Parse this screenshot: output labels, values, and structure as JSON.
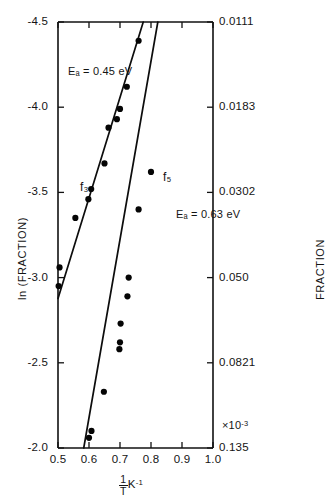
{
  "chart_data": {
    "type": "scatter",
    "title": "",
    "xlabel": "1/T K^-1",
    "xlabel_parts": {
      "numerator": "1",
      "denominator": "T",
      "unit": "K",
      "unit_exponent": "-1"
    },
    "ylabel": "ln (FRACTION)",
    "ylabel_right": "FRACTION",
    "x_multiplier": "×10",
    "x_multiplier_exponent": "-3",
    "xlim": [
      0.5,
      1.0
    ],
    "ylim": [
      -2.0,
      -4.5
    ],
    "grid": false,
    "legend_position": "inline-annotations",
    "x_ticks": [
      "0.5",
      "0.6",
      "0.7",
      "0.8",
      "0.9",
      "1.0"
    ],
    "x_tick_values": [
      0.5,
      0.6,
      0.7,
      0.8,
      0.9,
      1.0
    ],
    "y_ticks_left": [
      "-4.5",
      "-4.0",
      "-3.5",
      "-3.0",
      "-2.5",
      "-2.0"
    ],
    "y_tick_values_left": [
      -4.5,
      -4.0,
      -3.5,
      -3.0,
      -2.5,
      -2.0
    ],
    "y_ticks_right": [
      "0.0111",
      "0.0183",
      "0.0302",
      "0.050",
      "0.0821",
      "0.135"
    ],
    "y_tick_values_right": [
      0.0111,
      0.0183,
      0.0302,
      0.05,
      0.0821,
      0.135
    ],
    "series": [
      {
        "name": "f3",
        "label": "f₃",
        "activation_energy_label": "Eₐ = 0.45 eV",
        "activation_energy_value": 0.45,
        "activation_energy_units": "eV",
        "points": [
          {
            "x": 0.502,
            "y": -2.95
          },
          {
            "x": 0.505,
            "y": -3.06
          },
          {
            "x": 0.556,
            "y": -3.35
          },
          {
            "x": 0.598,
            "y": -3.46
          },
          {
            "x": 0.607,
            "y": -3.52
          },
          {
            "x": 0.65,
            "y": -3.67
          },
          {
            "x": 0.663,
            "y": -3.88
          },
          {
            "x": 0.69,
            "y": -3.93
          },
          {
            "x": 0.7,
            "y": -3.99
          },
          {
            "x": 0.722,
            "y": -4.12
          },
          {
            "x": 0.76,
            "y": -4.39
          }
        ],
        "fit_endpoints": [
          {
            "x": 0.497,
            "y": -2.86
          },
          {
            "x": 0.775,
            "y": -4.5
          }
        ]
      },
      {
        "name": "f5",
        "label": "f₅",
        "activation_energy_label": "Eₐ = 0.63 eV",
        "activation_energy_value": 0.63,
        "activation_energy_units": "eV",
        "points": [
          {
            "x": 0.6,
            "y": -2.06
          },
          {
            "x": 0.608,
            "y": -2.1
          },
          {
            "x": 0.648,
            "y": -2.33
          },
          {
            "x": 0.698,
            "y": -2.58
          },
          {
            "x": 0.7,
            "y": -2.62
          },
          {
            "x": 0.702,
            "y": -2.73
          },
          {
            "x": 0.724,
            "y": -2.89
          },
          {
            "x": 0.728,
            "y": -3.0
          },
          {
            "x": 0.76,
            "y": -3.4
          },
          {
            "x": 0.8,
            "y": -3.62
          }
        ],
        "fit_endpoints": [
          {
            "x": 0.583,
            "y": -2.0
          },
          {
            "x": 0.822,
            "y": -4.5
          }
        ]
      }
    ]
  }
}
